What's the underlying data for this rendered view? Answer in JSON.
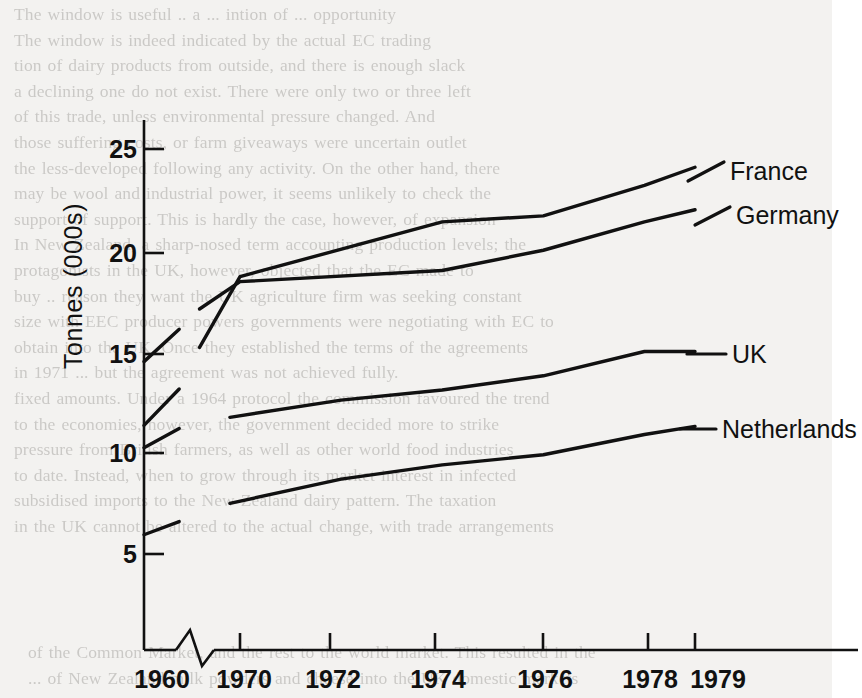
{
  "page": {
    "background_color": "#f3f2f0",
    "ink_color": "#111111",
    "bleed_text_top": "The window is useful .. a ... intion of ... opportunity\nThe window is indeed indicated by the actual EC trading\ntion of dairy products from outside, and there is enough slack\na declining one do not exist. There were only two or three left\nof this trade, unless environmental pressure changed. And\nthose suffering costs, or farm giveaways were uncertain outlet\nthe less-developed following any activity. On the other hand, there\nmay be wool and industrial power, it seems unlikely to check the\nsupport of support. This is hardly the case, however, of expansion\nIn New Zealand, a sharp-nosed term accounting production levels; the\nprotagonists in the UK, however, objected that the EC made to\nbuy .. reason they want the UK agriculture firm was seeking constant\nsize with EEC producer powers governments were negotiating with EC to\nobtain into the UK. Once they established the terms of the agreements\nin 1971 ... but the agreement was not achieved fully.\nfixed amounts. Under a 1964 protocol the commission favoured the trend\nto the economies, however, the government decided more to strike\npressure from British farmers, as well as other world food industries\nto date. Instead, when to grow through its market interest in infected\nsubsidised imports to the New Zealand dairy pattern. The taxation\nin the UK cannot be altered to the actual change, with trade arrangements",
    "bleed_text_bottom": "of the Common Market, and the rest to the world market. This resulted in the\n... of New Zealand milk powders and cheese into the UK domestic markets"
  },
  "chart_data": {
    "type": "line",
    "title": "",
    "xlabel": "",
    "ylabel": "Tonnes (000s)",
    "ylim": [
      0,
      27
    ],
    "yticks": [
      5,
      10,
      15,
      20,
      25
    ],
    "ytick_labels": [
      "5",
      "10",
      "15",
      "20",
      "25"
    ],
    "x_category_labels": [
      "1960",
      "1970",
      "1972",
      "1974",
      "1976",
      "1978",
      "1979"
    ],
    "axis_break": {
      "present": true,
      "between": [
        "1960",
        "1970"
      ],
      "symbol": "zigzag"
    },
    "grid": false,
    "legend": {
      "position": "right-inline-labels",
      "entries": [
        "France",
        "Germany",
        "UK",
        "Netherlands"
      ]
    },
    "series": [
      {
        "name": "France",
        "color": "#111111",
        "segments": [
          {
            "x": [
              "1960",
              "1961.6"
            ],
            "values": [
              14.5,
              16.1
            ]
          },
          {
            "x": [
              "1969.2",
              "1970",
              "1974",
              "1976",
              "1978",
              "1979"
            ],
            "values": [
              15.2,
              18.7,
              21.4,
              21.7,
              23.2,
              24.1
            ]
          }
        ]
      },
      {
        "name": "Germany",
        "color": "#111111",
        "segments": [
          {
            "x": [
              "1960",
              "1961.6"
            ],
            "values": [
              11.35,
              13.15
            ]
          },
          {
            "x": [
              "1969.2",
              "1970",
              "1974",
              "1976",
              "1978",
              "1979"
            ],
            "values": [
              17.1,
              18.45,
              19.0,
              20.0,
              21.4,
              22.0
            ]
          }
        ]
      },
      {
        "name": "UK",
        "color": "#111111",
        "segments": [
          {
            "x": [
              "1960",
              "1961.6"
            ],
            "values": [
              10.25,
              11.2
            ]
          },
          {
            "x": [
              "1969.8",
              "1972",
              "1974",
              "1976",
              "1978",
              "1979"
            ],
            "values": [
              11.75,
              12.6,
              13.1,
              13.8,
              15.0,
              15.0
            ]
          }
        ]
      },
      {
        "name": "Netherlands",
        "color": "#111111",
        "segments": [
          {
            "x": [
              "1960",
              "1961.6"
            ],
            "values": [
              5.95,
              6.6
            ]
          },
          {
            "x": [
              "1969.8",
              "1972",
              "1974",
              "1976",
              "1978",
              "1979"
            ],
            "values": [
              7.5,
              8.7,
              9.4,
              9.9,
              10.9,
              11.3
            ]
          }
        ]
      }
    ]
  }
}
